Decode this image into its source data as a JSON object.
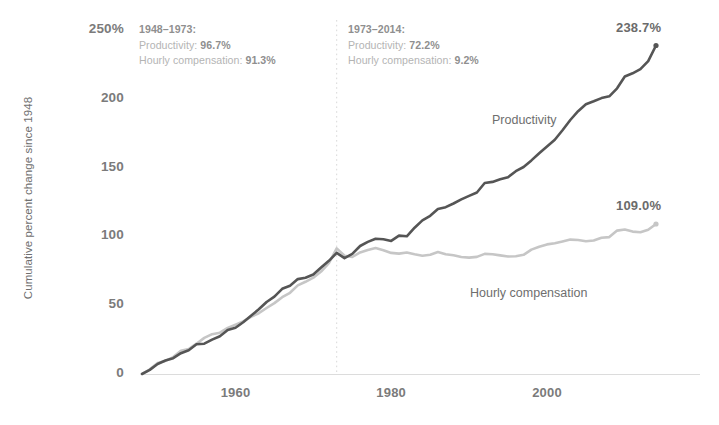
{
  "chart_data": {
    "type": "line",
    "title": "",
    "subtitle": "",
    "xlabel": "",
    "ylabel": "Cumulative percent change since 1948",
    "xlim": [
      1948,
      2014
    ],
    "ylim": [
      0,
      250
    ],
    "grid": false,
    "legend": "inline-series-labels",
    "y_ticks": [
      "250%",
      "200",
      "150",
      "100",
      "50",
      "0"
    ],
    "y_tick_values": [
      250,
      200,
      150,
      100,
      50,
      0
    ],
    "x_ticks": [
      "1960",
      "1980",
      "2000"
    ],
    "x_tick_values": [
      1960,
      1980,
      2000
    ],
    "x": [
      1948,
      1949,
      1950,
      1951,
      1952,
      1953,
      1954,
      1955,
      1956,
      1957,
      1958,
      1959,
      1960,
      1961,
      1962,
      1963,
      1964,
      1965,
      1966,
      1967,
      1968,
      1969,
      1970,
      1971,
      1972,
      1973,
      1974,
      1975,
      1976,
      1977,
      1978,
      1979,
      1980,
      1981,
      1982,
      1983,
      1984,
      1985,
      1986,
      1987,
      1988,
      1989,
      1990,
      1991,
      1992,
      1993,
      1994,
      1995,
      1996,
      1997,
      1998,
      1999,
      2000,
      2001,
      2002,
      2003,
      2004,
      2005,
      2006,
      2007,
      2008,
      2009,
      2010,
      2011,
      2012,
      2013,
      2014
    ],
    "series": [
      {
        "name": "Productivity",
        "color": "#555555",
        "end_value": 238.7,
        "end_label": "238.7%",
        "label_position": {
          "x": 492,
          "y": 113
        },
        "values": [
          0,
          3.0,
          7.3,
          9.8,
          11.5,
          15.1,
          17.3,
          21.6,
          22.0,
          25.0,
          27.5,
          32.0,
          33.6,
          37.6,
          42.4,
          47.0,
          52.3,
          56.2,
          61.9,
          64.2,
          69.0,
          70.0,
          72.3,
          77.4,
          82.3,
          88.0,
          84.2,
          87.3,
          93.0,
          96.0,
          98.3,
          98.0,
          96.7,
          100.6,
          100.1,
          106.3,
          111.6,
          115.0,
          119.9,
          121.2,
          123.9,
          126.9,
          129.4,
          131.9,
          138.8,
          139.6,
          141.5,
          143.0,
          147.4,
          150.4,
          155.2,
          160.5,
          165.4,
          170.2,
          177.2,
          184.6,
          191.0,
          196.0,
          198.2,
          200.5,
          201.8,
          207.6,
          216.2,
          218.5,
          221.6,
          227.4,
          238.7
        ]
      },
      {
        "name": "Hourly compensation",
        "color": "#c6c6c6",
        "end_value": 109.0,
        "end_label": "109.0%",
        "label_position": {
          "x": 470,
          "y": 286
        },
        "values": [
          0,
          3.4,
          8.1,
          9.5,
          12.3,
          16.9,
          18.2,
          22.0,
          26.2,
          28.9,
          30.0,
          33.5,
          35.8,
          38.2,
          41.6,
          44.2,
          48.0,
          51.5,
          55.8,
          59.0,
          64.4,
          67.0,
          70.0,
          74.5,
          80.6,
          91.3,
          86.0,
          85.0,
          88.4,
          90.1,
          91.5,
          90.0,
          88.0,
          87.5,
          88.3,
          87.1,
          86.0,
          86.7,
          88.6,
          87.0,
          86.3,
          85.0,
          84.6,
          85.1,
          87.3,
          87.0,
          86.2,
          85.4,
          85.6,
          86.6,
          90.4,
          92.5,
          94.2,
          95.0,
          96.3,
          97.7,
          97.4,
          96.5,
          97.0,
          99.0,
          99.5,
          104.2,
          105.0,
          103.5,
          103.0,
          104.8,
          109.0
        ]
      }
    ],
    "annotations": [
      {
        "id": "period-1948-1973",
        "heading": "1948–1973:",
        "lines": [
          {
            "label": "Productivity: ",
            "value": "96.7%"
          },
          {
            "label": "Hourly compensation: ",
            "value": "91.3%"
          }
        ],
        "position": {
          "x": 139,
          "y": 22
        }
      },
      {
        "id": "period-1973-2014",
        "heading": "1973–2014:",
        "lines": [
          {
            "label": "Productivity: ",
            "value": "72.2%"
          },
          {
            "label": "Hourly compensation: ",
            "value": "9.2%"
          }
        ],
        "position": {
          "x": 348,
          "y": 22
        }
      }
    ],
    "divider": {
      "year": 1973,
      "style": "dotted",
      "color": "#d8d8d8"
    }
  }
}
